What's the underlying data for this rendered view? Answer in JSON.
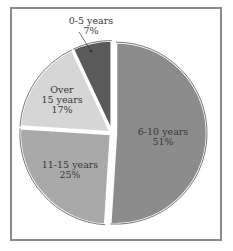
{
  "chart_data": {
    "type": "pie",
    "title": "",
    "categories": [
      "6-10 years",
      "11-15 years",
      "Over 15 years",
      "0-5 years"
    ],
    "values": [
      51,
      25,
      17,
      7
    ],
    "unit": "%",
    "slices": [
      {
        "label_lines": [
          "6-10 years",
          "51%"
        ],
        "value": 51,
        "color": "#8c8c8c",
        "exploded": true
      },
      {
        "label_lines": [
          "11-15 years",
          "25%"
        ],
        "value": 25,
        "color": "#a9a9a9",
        "exploded": false
      },
      {
        "label_lines": [
          "Over",
          "15 years",
          "17%"
        ],
        "value": 17,
        "color": "#d6d6d6",
        "exploded": false
      },
      {
        "label_lines": [
          "0-5 years",
          "7%"
        ],
        "value": 7,
        "color": "#5a5a5a",
        "exploded": false,
        "label_outside": true
      }
    ],
    "legend": "none",
    "grid": false
  }
}
